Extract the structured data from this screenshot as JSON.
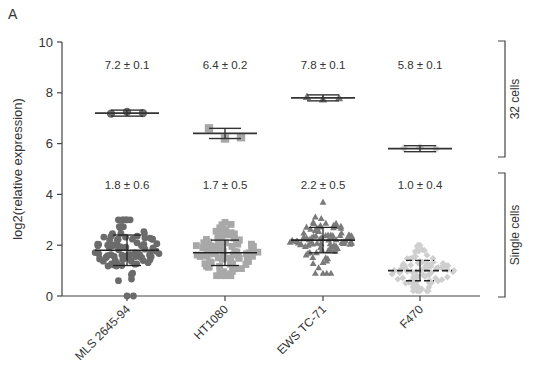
{
  "panel_label": "A",
  "chart_data": {
    "type": "scatter",
    "subtype": "dot-plot-with-mean-sd",
    "title": "",
    "xlabel": "",
    "ylabel": "log2(relative expression)",
    "ylim": [
      0,
      10
    ],
    "yticks": [
      0,
      2,
      4,
      6,
      8,
      10
    ],
    "grid": false,
    "categories": [
      "MLS 2645-94",
      "HT1080",
      "EWS TC-71",
      "F470"
    ],
    "groups": [
      {
        "name": "32 cells",
        "series": [
          {
            "category": "MLS 2645-94",
            "mean": 7.2,
            "sd": 0.1,
            "label": "7.2 ± 0.1",
            "marker": "circle",
            "color": "#6b6b6b",
            "points": [
              7.18,
              7.25,
              7.2
            ]
          },
          {
            "category": "HT1080",
            "mean": 6.4,
            "sd": 0.2,
            "label": "6.4  ± 0.2",
            "marker": "square",
            "color": "#a8a8a8",
            "points": [
              6.6,
              6.2,
              6.25
            ]
          },
          {
            "category": "EWS TC-71",
            "mean": 7.8,
            "sd": 0.1,
            "label": "7.8  ± 0.1",
            "marker": "triangle",
            "color": "#7a7a7a",
            "points": [
              7.85,
              7.75,
              7.8
            ]
          },
          {
            "category": "F470",
            "mean": 5.8,
            "sd": 0.1,
            "label": "5.8 ± 0.1",
            "marker": "diamond",
            "color": "#cfcfcf",
            "points": [
              5.82,
              5.85,
              5.8
            ]
          }
        ]
      },
      {
        "name": "Single cells",
        "series": [
          {
            "category": "MLS 2645-94",
            "mean": 1.8,
            "sd": 0.6,
            "label": "1.8 ± 0.6",
            "marker": "circle",
            "color": "#6b6b6b",
            "range": [
              0.0,
              3.0
            ]
          },
          {
            "category": "HT1080",
            "mean": 1.7,
            "sd": 0.5,
            "label": "1.7 ± 0.5",
            "marker": "square",
            "color": "#a8a8a8",
            "range": [
              0.8,
              2.9
            ]
          },
          {
            "category": "EWS TC-71",
            "mean": 2.2,
            "sd": 0.5,
            "label": "2.2 ± 0.5",
            "marker": "triangle",
            "color": "#7a7a7a",
            "range": [
              0.9,
              3.7
            ]
          },
          {
            "category": "F470",
            "mean": 1.0,
            "sd": 0.4,
            "label": "1.0  ± 0.4",
            "marker": "diamond",
            "color": "#cfcfcf",
            "range": [
              0.2,
              2.0
            ]
          }
        ]
      }
    ],
    "bracket_labels": [
      "32 cells",
      "Single cells"
    ]
  }
}
